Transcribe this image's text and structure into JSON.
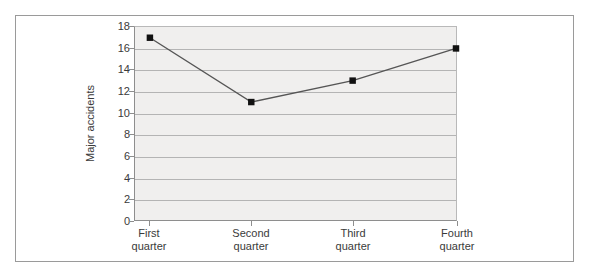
{
  "chart_data": {
    "type": "line",
    "title": "",
    "xlabel": "",
    "ylabel": "Major accidents",
    "categories": [
      "First\nquarter",
      "Second\nquarter",
      "Third\nquarter",
      "Fourth\nquarter"
    ],
    "values": [
      17,
      11,
      13,
      16
    ],
    "ylim": [
      0,
      18
    ],
    "yticks": [
      0,
      2,
      4,
      6,
      8,
      10,
      12,
      14,
      16,
      18
    ],
    "ytick_labels": [
      "0",
      "2",
      "4",
      "6",
      "8",
      "10",
      "12",
      "14",
      "16",
      "18"
    ],
    "grid": true,
    "grid_axis": "y",
    "legend": false,
    "legend_position": "none",
    "series": [
      {
        "name": "Major accidents",
        "values": [
          17,
          11,
          13,
          16
        ],
        "marker": "square",
        "marker_color": "#111111",
        "line_color": "#555555"
      }
    ],
    "plot_background": "#f0efee",
    "gridline_color": "#b4b4b4",
    "axis_color": "#8e8e8e",
    "frame_color": "#9a9a9a",
    "page_background": "#ffffff"
  }
}
